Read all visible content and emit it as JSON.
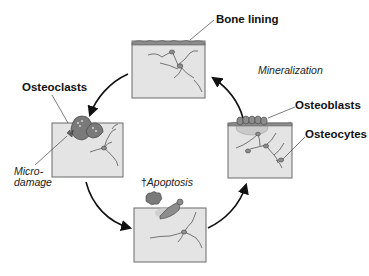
{
  "diagram": {
    "labels": {
      "bone_lining": "Bone lining",
      "mineralization": "Mineralization",
      "osteoblasts": "Osteoblasts",
      "osteocytes": "Osteocytes",
      "osteoclasts": "Osteoclasts",
      "microdamage_line1": "Micro-",
      "microdamage_line2": "damage",
      "apoptosis_dagger": "†",
      "apoptosis": "Apoptosis"
    },
    "stages": [
      {
        "id": "resting",
        "position": "top",
        "note": "bone lining cells on surface"
      },
      {
        "id": "resorption",
        "position": "left",
        "note": "osteoclasts at microdamage"
      },
      {
        "id": "reversal",
        "position": "bottom",
        "note": "apoptosis of osteoclast"
      },
      {
        "id": "formation",
        "position": "right",
        "note": "osteoblasts and osteocytes"
      }
    ],
    "colors": {
      "box_fill": "#e4e4e4",
      "box_stroke": "#6a6a6a",
      "cell_fill": "#8c8c8c",
      "osteoclast_fill": "#7a7a7a",
      "osteoid_fill": "#c9c9c9",
      "arrow": "#111111"
    }
  }
}
